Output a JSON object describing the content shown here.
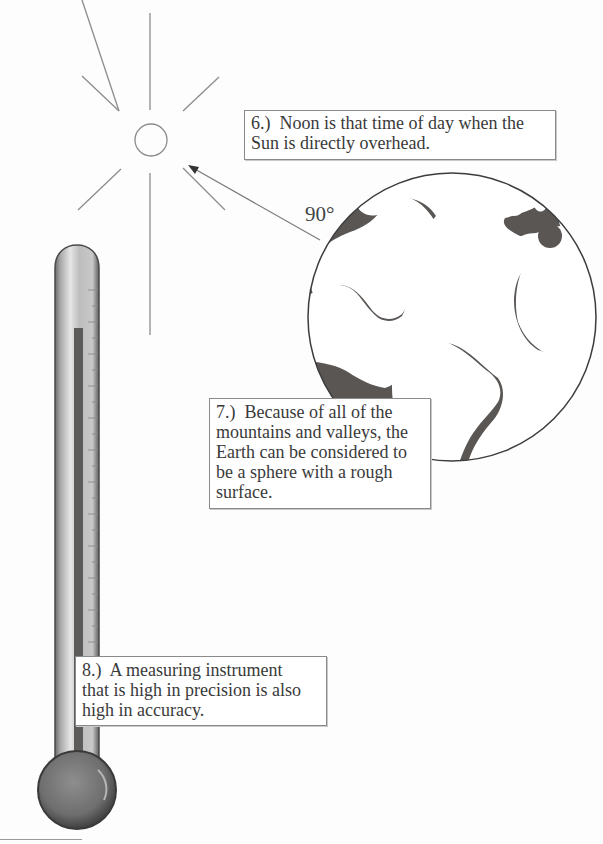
{
  "page": {
    "type": "textbook-worksheet-illustration",
    "background_color": "#fdfdfd",
    "ink_color": "#3a3a3a",
    "land_ocean_dark_color": "#5a5654"
  },
  "illustrations": {
    "sun": {
      "icon": "sun-icon",
      "rays": 8
    },
    "arrow": {
      "icon": "arrow-icon",
      "direction": "from-earth-to-sun"
    },
    "angle_label": "90°",
    "globe": {
      "icon": "earth-globe-icon"
    },
    "thermometer": {
      "icon": "thermometer-icon"
    }
  },
  "statements": [
    {
      "number": "6.)",
      "text": "Noon is that time of day when the Sun is directly overhead.",
      "lines": [
        "6.)  Noon is that time of day when the",
        "Sun is directly overhead."
      ]
    },
    {
      "number": "7.)",
      "text": "Because of all of the mountains and valleys, the Earth can be considered to be a sphere with a rough surface.",
      "lines": [
        "7.)  Because of all of the",
        "mountains and valleys, the",
        "Earth can be considered to",
        "be a sphere with a rough",
        "surface."
      ]
    },
    {
      "number": "8.)",
      "text": "A measuring instrument that is high in precision is also high in accuracy.",
      "lines": [
        "8.)  A measuring instrument",
        "that is high in precision is also",
        "high in accuracy."
      ]
    }
  ]
}
